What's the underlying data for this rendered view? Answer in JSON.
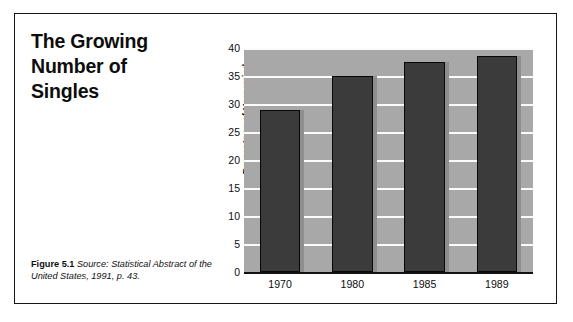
{
  "figure": {
    "title": "The Growing\nNumber of\nSingles",
    "caption_label": "Figure 5.1",
    "caption_text": " Source: Statistical Abstract of the United States, 1991, p. 43."
  },
  "colors": {
    "plot_background": "#a8a8a8",
    "bar_fill": "#3b3b3b",
    "bar_outline": "#080808",
    "bar_shadow": "#8e8e8e",
    "gridline": "#fbfbfb",
    "axis": "#111111",
    "frame": "#151515",
    "text": "#0d0d0d",
    "page_background": "#ffffff"
  },
  "chart_data": {
    "type": "bar",
    "title": "The Growing Number of Singles",
    "categories": [
      "1970",
      "1980",
      "1985",
      "1989"
    ],
    "values": [
      29,
      35,
      37.5,
      38.5
    ],
    "xlabel": "",
    "ylabel": "Percentage of Unmarried\nPeople Over 18",
    "ylim": [
      0,
      40
    ],
    "yticks": [
      0,
      5,
      10,
      15,
      20,
      25,
      30,
      35,
      40
    ],
    "ytick_labels": [
      "0",
      "5",
      "10",
      "15",
      "20",
      "25",
      "30",
      "35",
      "40"
    ],
    "grid": true,
    "grid_axis": "y",
    "legend": false,
    "legend_position": "none",
    "source": "Statistical Abstract of the United States, 1991, p. 43."
  }
}
